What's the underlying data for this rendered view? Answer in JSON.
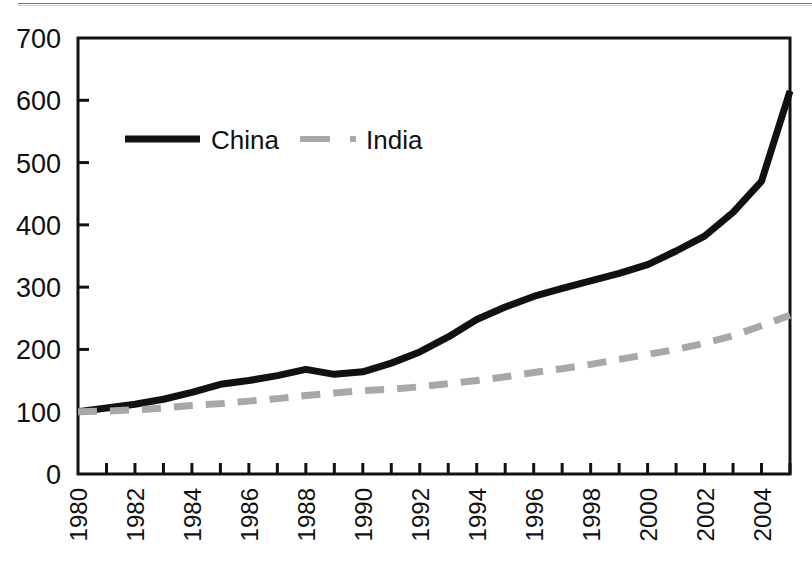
{
  "chart_data": {
    "type": "line",
    "title": "",
    "subtitle": "",
    "xlabel": "",
    "ylabel": "",
    "xlim": [
      1980,
      2005
    ],
    "ylim": [
      0,
      700
    ],
    "grid": false,
    "legend_position": "top-left",
    "x": [
      1980,
      1981,
      1982,
      1983,
      1984,
      1985,
      1986,
      1987,
      1988,
      1989,
      1990,
      1991,
      1992,
      1993,
      1994,
      1995,
      1996,
      1997,
      1998,
      1999,
      2000,
      2001,
      2002,
      2003,
      2004,
      2005
    ],
    "x_tick_labels": [
      "1980",
      "1982",
      "1984",
      "1986",
      "1988",
      "1990",
      "1992",
      "1994",
      "1996",
      "1998",
      "2000",
      "2002",
      "2004"
    ],
    "y_tick_labels": [
      "0",
      "100",
      "200",
      "300",
      "400",
      "500",
      "600",
      "700"
    ],
    "y_ticks": [
      0,
      100,
      200,
      300,
      400,
      500,
      600,
      700
    ],
    "series": [
      {
        "name": "China",
        "color": "#111111",
        "style": "solid",
        "width": 7,
        "values": [
          100,
          106,
          112,
          120,
          131,
          144,
          150,
          158,
          168,
          160,
          164,
          178,
          196,
          220,
          248,
          268,
          285,
          298,
          310,
          322,
          336,
          358,
          382,
          420,
          470,
          615
        ]
      },
      {
        "name": "India",
        "color": "#a8a8a8",
        "style": "dashed",
        "width": 7,
        "values": [
          100,
          101,
          103,
          106,
          110,
          113,
          117,
          121,
          126,
          130,
          134,
          136,
          140,
          145,
          150,
          156,
          163,
          169,
          176,
          184,
          192,
          200,
          210,
          222,
          238,
          255
        ]
      }
    ]
  },
  "legend": {
    "items": [
      {
        "label": "China",
        "color": "#111111",
        "style": "solid"
      },
      {
        "label": "India",
        "color": "#a8a8a8",
        "style": "dashed"
      }
    ]
  },
  "axes": {
    "y_axis_name": "value-axis",
    "x_axis_name": "year-axis"
  }
}
